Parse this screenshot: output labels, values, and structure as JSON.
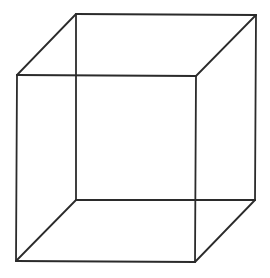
{
  "diagram": {
    "type": "wireframe-cube",
    "background": "#ffffff",
    "stroke_color": "#2b2b2b",
    "stroke_width": 1.8,
    "vertices": {
      "front_top_left": [
        17,
        75
      ],
      "front_top_right": [
        196,
        76
      ],
      "front_bottom_left": [
        16,
        261
      ],
      "front_bottom_right": [
        195,
        262
      ],
      "back_top_left": [
        76,
        14
      ],
      "back_top_right": [
        256,
        15
      ],
      "back_bottom_left": [
        76,
        200
      ],
      "back_bottom_right": [
        255,
        200
      ]
    },
    "edges": [
      [
        "front_top_left",
        "front_top_right"
      ],
      [
        "front_top_right",
        "front_bottom_right"
      ],
      [
        "front_bottom_right",
        "front_bottom_left"
      ],
      [
        "front_bottom_left",
        "front_top_left"
      ],
      [
        "back_top_left",
        "back_top_right"
      ],
      [
        "back_top_right",
        "back_bottom_right"
      ],
      [
        "back_bottom_right",
        "back_bottom_left"
      ],
      [
        "back_bottom_left",
        "back_top_left"
      ],
      [
        "front_top_left",
        "back_top_left"
      ],
      [
        "front_top_right",
        "back_top_right"
      ],
      [
        "front_bottom_left",
        "back_bottom_left"
      ],
      [
        "front_bottom_right",
        "back_bottom_right"
      ]
    ]
  }
}
